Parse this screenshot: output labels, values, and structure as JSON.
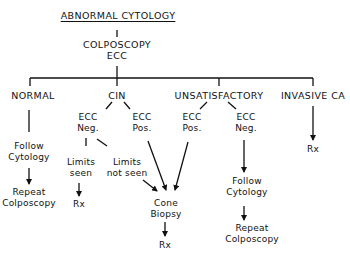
{
  "diagram": {
    "root": "ABNORMAL CYTOLOGY",
    "procedure": {
      "line1": "COLPOSCOPY",
      "line2": "ECC"
    },
    "branches": {
      "normal": {
        "label": "NORMAL",
        "step1": {
          "line1": "Follow",
          "line2": "Cytology"
        },
        "step2": {
          "line1": "Repeat",
          "line2": "Colposcopy"
        }
      },
      "cin": {
        "label": "CIN",
        "ecc_neg": {
          "line1": "ECC",
          "line2": "Neg."
        },
        "ecc_pos": {
          "line1": "ECC",
          "line2": "Pos."
        },
        "limits_seen": {
          "line1": "Limits",
          "line2": "seen"
        },
        "limits_not_seen": {
          "line1": "Limits",
          "line2": "not seen"
        },
        "limits_seen_outcome": "Rx"
      },
      "unsatisfactory": {
        "label": "UNSATISFACTORY",
        "ecc_pos": {
          "line1": "ECC",
          "line2": "Pos."
        },
        "ecc_neg": {
          "line1": "ECC",
          "line2": "Neg."
        },
        "step1": {
          "line1": "Follow",
          "line2": "Cytology"
        },
        "step2": {
          "line1": "Repeat",
          "line2": "Colposcopy"
        }
      },
      "invasive": {
        "label": "INVASIVE CA",
        "outcome": "Rx"
      }
    },
    "cone_biopsy": {
      "line1": "Cone",
      "line2": "Biopsy",
      "outcome": "Rx"
    }
  }
}
